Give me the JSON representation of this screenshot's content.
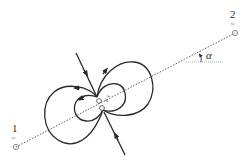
{
  "diagram": {
    "title": "",
    "colors": {
      "line": "#2a2a2a",
      "dotted": "#555555",
      "marker": "#888888"
    },
    "points": [
      {
        "id": "1",
        "label": "1",
        "sublabel": "z",
        "x": 16,
        "y": 147
      },
      {
        "id": "2",
        "label": "2",
        "sublabel": "z",
        "x": 235,
        "y": 33
      }
    ],
    "angle": {
      "label": "α"
    },
    "center": {
      "label": "μ τ"
    }
  }
}
